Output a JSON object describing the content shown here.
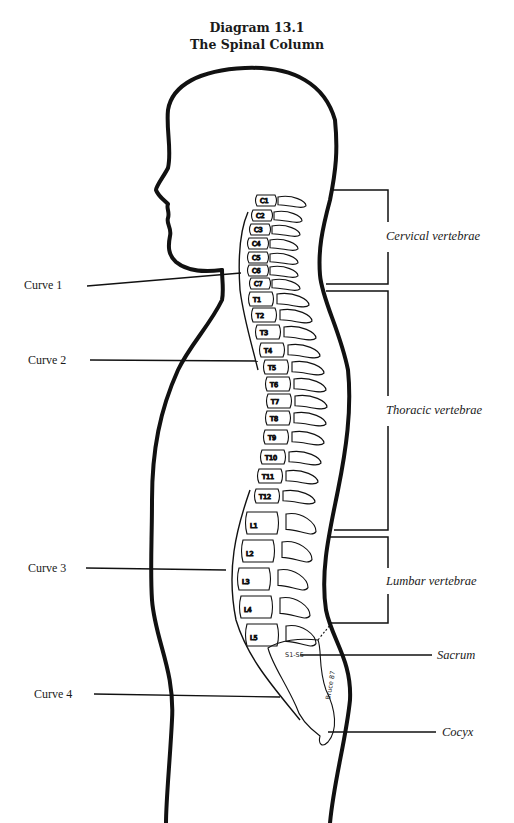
{
  "title": {
    "line1": "Diagram 13.1",
    "line2": "The Spinal Column"
  },
  "left_labels": [
    {
      "id": "curve1",
      "text": "Curve 1"
    },
    {
      "id": "curve2",
      "text": "Curve 2"
    },
    {
      "id": "curve3",
      "text": "Curve 3"
    },
    {
      "id": "curve4",
      "text": "Curve 4"
    }
  ],
  "right_labels": [
    {
      "id": "cervical",
      "text": "Cervical vertebrae"
    },
    {
      "id": "thoracic",
      "text": "Thoracic vertebrae"
    },
    {
      "id": "lumbar",
      "text": "Lumbar vertebrae"
    },
    {
      "id": "sacrum",
      "text": "Sacrum"
    },
    {
      "id": "cocyx",
      "text": "Cocyx"
    }
  ],
  "vertebrae": {
    "cervical": [
      "C1",
      "C2",
      "C3",
      "C4",
      "C5",
      "C6",
      "C7"
    ],
    "thoracic": [
      "T1",
      "T2",
      "T3",
      "T4",
      "T5",
      "T6",
      "T7",
      "T8",
      "T9",
      "T10",
      "T11",
      "T12"
    ],
    "lumbar": [
      "L1",
      "L2",
      "L3",
      "L4",
      "L5"
    ],
    "sacral": "S1-S5"
  },
  "colors": {
    "outline": "#111111",
    "text": "#1a1a1a",
    "background": "#ffffff"
  }
}
